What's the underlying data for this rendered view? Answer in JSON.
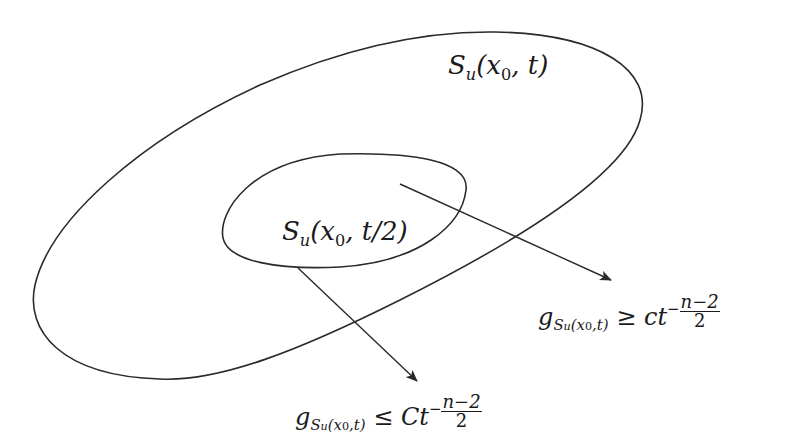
{
  "diagram": {
    "colors": {
      "stroke": "#2a2a2a",
      "text": "#1a1a1a",
      "background": "#ffffff"
    },
    "outer_set": {
      "label": {
        "S": "S",
        "sub": "u",
        "args": "(x",
        "arg_sub": "0",
        "rest": ", t)"
      }
    },
    "inner_set": {
      "label": {
        "S": "S",
        "sub": "u",
        "args": "(x",
        "arg_sub": "0",
        "rest": ", t/2)"
      }
    },
    "lower_bound": {
      "g": "g",
      "sub_S": "S",
      "sub_u": "u",
      "sub_args": "(x",
      "sub_x0": "0",
      "sub_rest": ",t)",
      "relation": "≥",
      "coef": "ct",
      "exp_sign": "−",
      "exp_num": "n−2",
      "exp_den": "2"
    },
    "upper_bound": {
      "g": "g",
      "sub_S": "S",
      "sub_u": "u",
      "sub_args": "(x",
      "sub_x0": "0",
      "sub_rest": ",t)",
      "relation": "≤",
      "coef": "Ct",
      "exp_sign": "−",
      "exp_num": "n−2",
      "exp_den": "2"
    }
  }
}
